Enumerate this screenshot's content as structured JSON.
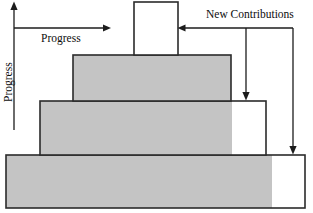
{
  "diagram": {
    "colors": {
      "fill_gray": "#c4c4c4",
      "fill_white": "#ffffff",
      "outline": "#2b2b2b",
      "annotation": "#1c1c1c",
      "background": "#ffffff"
    },
    "labels": {
      "progress_horizontal": "Progress",
      "progress_vertical": "Progress",
      "new_contributions": "New Contributions"
    },
    "tiers": [
      {
        "name": "tier-1-top",
        "index": 1,
        "x": 134,
        "y": 2,
        "width": 44,
        "height": 53,
        "gray_width": 0,
        "white_width": 44,
        "fully_gray": false
      },
      {
        "name": "tier-2",
        "index": 2,
        "x": 73,
        "y": 55,
        "width": 158,
        "height": 46,
        "gray_width": 158,
        "white_width": 0,
        "fully_gray": true
      },
      {
        "name": "tier-3",
        "index": 3,
        "x": 40,
        "y": 101,
        "width": 226,
        "height": 54,
        "gray_width": 192,
        "white_width": 34,
        "fully_gray": false
      },
      {
        "name": "tier-4-bottom",
        "index": 4,
        "x": 6,
        "y": 155,
        "width": 299,
        "height": 53,
        "gray_width": 266,
        "white_width": 33,
        "fully_gray": false
      }
    ],
    "annotations": {
      "vertical_axis": {
        "name": "progress-vertical-axis",
        "x": 14,
        "y_top": 3,
        "y_bottom": 130,
        "arrow_at": "top"
      },
      "horizontal_axis": {
        "name": "progress-horizontal-axis",
        "y": 28,
        "x_start": 14,
        "x_end": 110,
        "arrow_at": "right"
      },
      "contribution_leader": {
        "name": "new-contributions-leader",
        "y": 28,
        "x_left": 178,
        "x_right": 293,
        "arrow_at": "left"
      },
      "contribution_drops": [
        {
          "name": "drop-to-tier-3",
          "x": 246,
          "y_start": 28,
          "y_end": 100
        },
        {
          "name": "drop-to-tier-4",
          "x": 293,
          "y_start": 28,
          "y_end": 154
        }
      ]
    }
  }
}
